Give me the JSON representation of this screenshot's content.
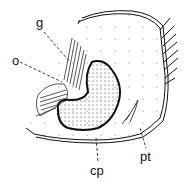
{
  "figure": {
    "labels": {
      "g": "g",
      "o": "o",
      "cp": "cp",
      "pt": "pt"
    },
    "colors": {
      "ink": "#111111",
      "background": "#ffffff"
    }
  }
}
